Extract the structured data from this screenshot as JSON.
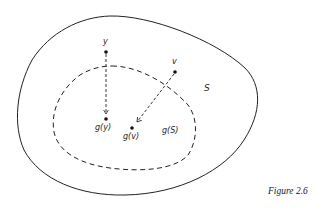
{
  "diagram": {
    "sets": [
      {
        "id": "S",
        "label": "S",
        "style": "solid"
      },
      {
        "id": "gS",
        "label": "g(S)",
        "style": "dashed"
      }
    ],
    "points": [
      {
        "id": "y",
        "label": "y"
      },
      {
        "id": "v",
        "label": "v"
      },
      {
        "id": "gy",
        "label": "g(y)"
      },
      {
        "id": "gv",
        "label": "g(v)"
      }
    ],
    "arrows": [
      {
        "from": "y",
        "to": "g(y)",
        "style": "dashed"
      },
      {
        "from": "v",
        "to": "g(v)",
        "style": "dashed"
      }
    ],
    "caption": "Figure 2.6"
  }
}
